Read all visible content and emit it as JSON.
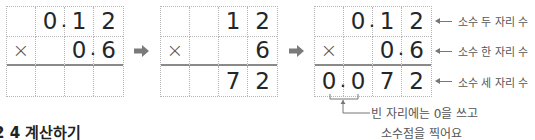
{
  "steps": [
    {
      "rows": [
        [
          "",
          "0.",
          "1",
          "2"
        ],
        [
          "×",
          "",
          "0.",
          "6"
        ],
        [
          "",
          "",
          "",
          ""
        ]
      ]
    },
    {
      "rows": [
        [
          "",
          "",
          "1",
          "2"
        ],
        [
          "×",
          "",
          "",
          "6"
        ],
        [
          "",
          "",
          "7",
          "2"
        ]
      ]
    },
    {
      "rows": [
        [
          "",
          "0.",
          "1",
          "2"
        ],
        [
          "×",
          "",
          "0.",
          "6"
        ],
        [
          "0.",
          "0",
          "7",
          "2"
        ]
      ]
    }
  ],
  "annotations": {
    "row1": "소수 두 자리 수",
    "row2": "소수 한 자리 수",
    "row3": "소수 세 자리 수"
  },
  "note": {
    "line1": "빈 자리에는 0을 쓰고",
    "line2": "소수점을 찍어요"
  },
  "heading": "2 4 계산하기",
  "colors": {
    "grid_line": "#b5b5b5",
    "product_line": "#8a8a8a",
    "arrow": "#7a7a7a",
    "digits": "#262626"
  }
}
